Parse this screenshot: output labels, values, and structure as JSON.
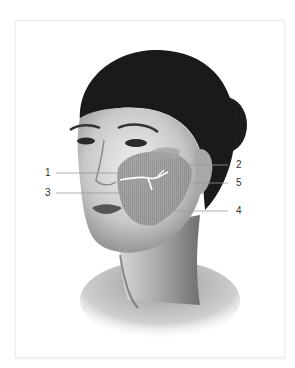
{
  "figure": {
    "type": "anatomical-illustration",
    "highlighted_region": "cheek / midface zone",
    "labels": [
      {
        "id": "1",
        "text": "1",
        "side": "left"
      },
      {
        "id": "2",
        "text": "2",
        "side": "right"
      },
      {
        "id": "3",
        "text": "3",
        "side": "left"
      },
      {
        "id": "4",
        "text": "4",
        "side": "right"
      },
      {
        "id": "5",
        "text": "5",
        "side": "right"
      }
    ]
  },
  "colors": {
    "hair": "#1a1a1a",
    "skin_light": "#e8e8e8",
    "skin_mid": "#b8b8b8",
    "skin_shadow": "#7a7a7a",
    "overlay": "#8f8f8f",
    "leader_line": "#9a9a9a",
    "label_text": "#333333",
    "frame_border": "#ececec"
  }
}
